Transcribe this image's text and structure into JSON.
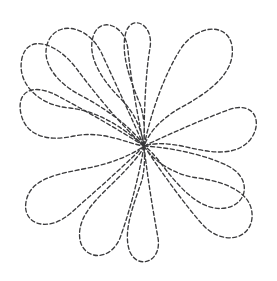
{
  "document": {
    "title": "Dashed Feather Pinwheel Quilting Motif",
    "kind": "line-art-illustration",
    "subject": "twelve-petal swirling feather / pinwheel medallion",
    "background_color": "#ffffff",
    "width": 277,
    "height": 281
  },
  "style": {
    "stroke_color": "#3a3a3c",
    "stroke_width": 1.35,
    "dash_length": 4.0,
    "dash_gap": 2.6,
    "line_cap": "round",
    "fill": "none"
  },
  "geometry": {
    "center_x": 144,
    "center_y": 146,
    "bounds": {
      "left": 20,
      "top": 23,
      "right": 258,
      "bottom": 268
    },
    "petal_count": 12,
    "swirl_direction": "counterclockwise"
  },
  "petals": [
    {
      "id": "petal-1",
      "label": "top-left-large",
      "tip_x": 36,
      "tip_y": 48,
      "d": "M144,146 C116,128 84,110 58,96 C32,82 16,92 21,114 C26,136 48,142 74,136 C104,130 128,144 144,146 Z"
    },
    {
      "id": "petal-2",
      "label": "upper-left-outer",
      "tip_x": 30,
      "tip_y": 94,
      "d": "M144,146 C118,122 94,92 76,68 C56,42 28,34 22,58 C16,84 40,106 70,108 C104,112 130,134 144,146 Z"
    },
    {
      "id": "petal-3",
      "label": "upper-left-upright",
      "tip_x": 70,
      "tip_y": 28,
      "d": "M144,146 C128,110 112,76 102,54 C90,28 62,20 50,38 C38,58 54,82 82,96 C112,112 136,132 144,146 Z"
    },
    {
      "id": "petal-4",
      "label": "top-center-left",
      "tip_x": 110,
      "tip_y": 25,
      "d": "M144,146 C136,108 130,72 128,50 C126,26 102,16 94,34 C86,54 100,78 120,98 C138,116 142,134 144,146 Z"
    },
    {
      "id": "petal-5",
      "label": "top-center-right",
      "tip_x": 148,
      "tip_y": 24,
      "d": "M144,146 C144,108 146,70 150,48 C154,24 132,14 126,32 C120,52 130,80 140,104 C146,122 144,136 144,146 Z"
    },
    {
      "id": "petal-6",
      "label": "top-right-large",
      "tip_x": 200,
      "tip_y": 36,
      "d": "M144,146 C152,108 166,72 180,50 C196,24 228,22 232,46 C236,72 210,92 180,108 C156,122 148,136 144,146 Z"
    },
    {
      "id": "petal-7",
      "label": "right-upper",
      "tip_x": 242,
      "tip_y": 104,
      "d": "M144,146 C174,132 206,118 228,110 C254,100 264,122 250,140 C234,158 208,152 182,146 C160,142 150,144 144,146 Z"
    },
    {
      "id": "petal-8",
      "label": "right-lower",
      "tip_x": 242,
      "tip_y": 170,
      "d": "M144,146 C176,148 208,156 228,166 C252,178 248,204 226,208 C202,212 182,190 166,170 C154,154 148,148 144,146 Z"
    },
    {
      "id": "petal-9",
      "label": "bottom-right-large",
      "tip_x": 206,
      "tip_y": 240,
      "d": "M144,146 C164,176 186,206 202,224 C222,246 250,240 252,218 C254,194 228,182 198,178 C168,174 150,156 144,146 Z"
    },
    {
      "id": "petal-10",
      "label": "bottom-center-right",
      "tip_x": 152,
      "tip_y": 256,
      "d": "M144,146 C148,182 154,216 158,238 C162,262 138,270 130,252 C122,232 134,204 142,180 C146,162 144,152 144,146 Z"
    },
    {
      "id": "petal-11",
      "label": "bottom-center-left",
      "tip_x": 104,
      "tip_y": 258,
      "d": "M144,146 C138,182 128,216 120,238 C110,262 84,260 80,240 C76,216 98,198 116,180 C134,162 142,152 144,146 Z"
    },
    {
      "id": "petal-12",
      "label": "bottom-left-large",
      "tip_x": 52,
      "tip_y": 232,
      "d": "M144,146 C120,170 92,194 72,212 C48,234 22,224 26,202 C30,178 58,174 88,168 C118,162 136,152 144,146 Z"
    }
  ],
  "annotations": {
    "visible_text": [],
    "has_labels": false
  }
}
